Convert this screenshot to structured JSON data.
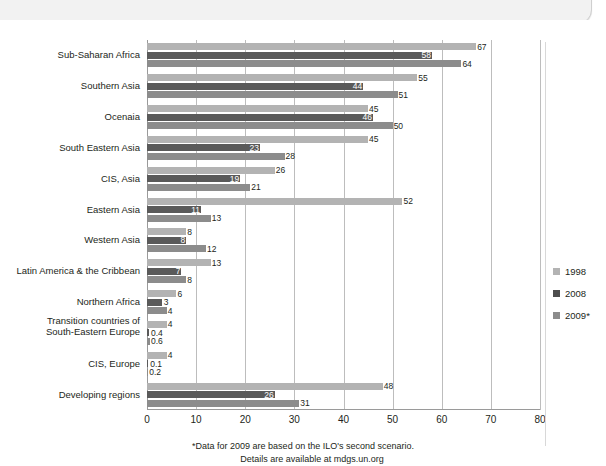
{
  "chart_data": {
    "type": "bar",
    "orientation": "horizontal",
    "title": "",
    "xlabel": "",
    "ylabel": "",
    "xlim": [
      0,
      80
    ],
    "xticks": [
      "0",
      "10",
      "20",
      "30",
      "40",
      "50",
      "60",
      "70",
      "80"
    ],
    "xtick_values": [
      0,
      10,
      20,
      30,
      40,
      50,
      60,
      70,
      80
    ],
    "grid": true,
    "legend_position": "right",
    "categories": [
      "Sub-Saharan Africa",
      "Southern Asia",
      "Ocenaia",
      "South Eastern Asia",
      "CIS, Asia",
      "Eastern Asia",
      "Western Asia",
      "Latin America & the Cribbean",
      "Northern Africa",
      "Transition countries of South-Eastern Europe",
      "CIS, Europe",
      "Developing regions"
    ],
    "series": [
      {
        "name": "1998",
        "color": "#b3b3b3",
        "values": [
          67,
          55,
          45,
          45,
          26,
          52,
          8,
          13,
          6,
          4,
          4,
          48
        ],
        "labels": [
          "67",
          "55",
          "45",
          "45",
          "26",
          "52",
          "8",
          "13",
          "6",
          "4",
          "4",
          "48"
        ]
      },
      {
        "name": "2008",
        "color": "#5a5a5a",
        "values": [
          58,
          44,
          46,
          23,
          19,
          11,
          8,
          7,
          3,
          0.4,
          0.1,
          26
        ],
        "labels": [
          "58",
          "44",
          "46",
          "23",
          "19",
          "11",
          "8",
          "7",
          "3",
          "0.4",
          "0.1",
          "26"
        ]
      },
      {
        "name": "2009*",
        "color": "#8c8c8c",
        "values": [
          64,
          51,
          50,
          28,
          21,
          13,
          12,
          8,
          4,
          0.6,
          0.2,
          31
        ],
        "labels": [
          "64",
          "51",
          "50",
          "28",
          "21",
          "13",
          "12",
          "8",
          "4",
          "0.6",
          "0.2",
          "31"
        ]
      }
    ],
    "footnotes": [
      "*Data for 2009 are based on the ILO's second scenario.",
      "Details are available at mdgs.un.org"
    ]
  },
  "legend": {
    "items": [
      {
        "label": "1998",
        "color": "#b3b3b3"
      },
      {
        "label": "2008",
        "color": "#4d4d4d"
      },
      {
        "label": "2009*",
        "color": "#8c8c8c"
      }
    ]
  },
  "colors": {
    "series_1998": "#b3b3b3",
    "series_2008": "#5a5a5a",
    "series_2009": "#8c8c8c",
    "gridline": "#bdbdbd",
    "text": "#231f20",
    "background": "#ffffff"
  }
}
